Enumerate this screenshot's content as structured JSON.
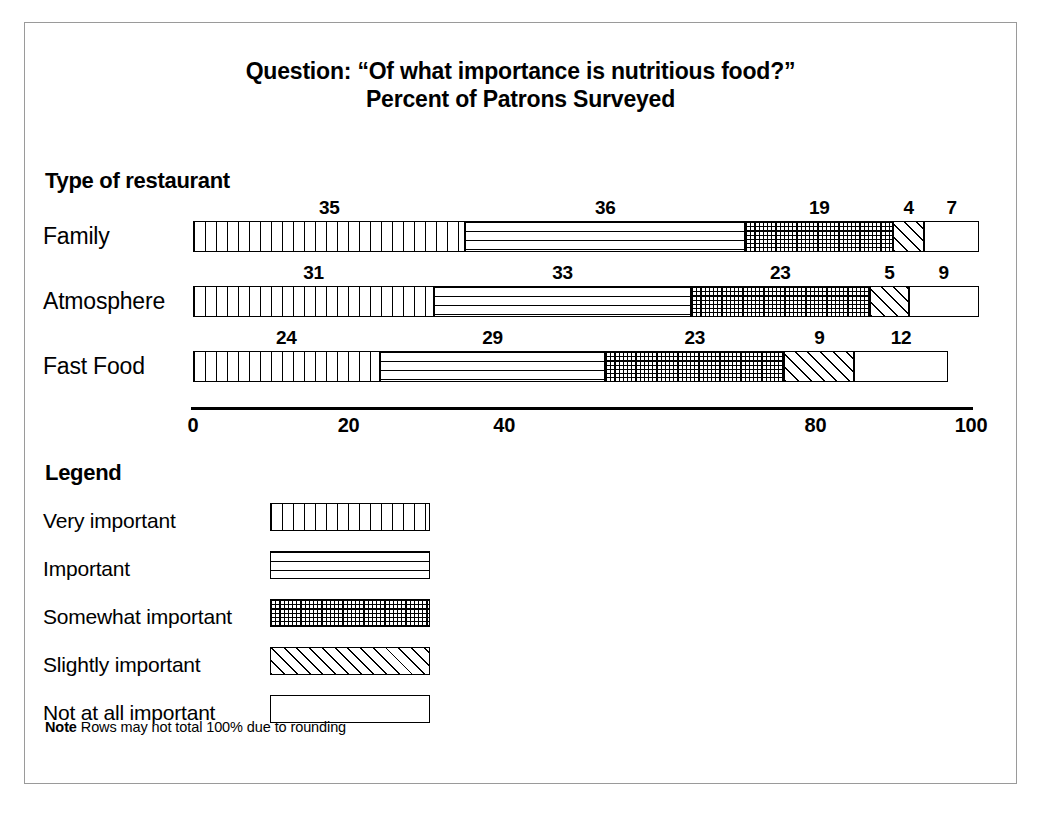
{
  "chart_data": {
    "type": "bar",
    "orientation": "horizontal",
    "stacked": true,
    "title": "Question: “Of what importance is nutritious food?”",
    "subtitle": "Percent of Patrons Surveyed",
    "category_axis_title": "Type of restaurant",
    "categories": [
      "Family",
      "Atmosphere",
      "Fast Food"
    ],
    "series": [
      {
        "name": "Very important",
        "pattern": "vertical",
        "values": [
          35,
          31,
          24
        ]
      },
      {
        "name": "Important",
        "pattern": "horizontal",
        "values": [
          36,
          33,
          29
        ]
      },
      {
        "name": "Somewhat important",
        "pattern": "grid",
        "values": [
          19,
          23,
          23
        ]
      },
      {
        "name": "Slightly important",
        "pattern": "diagonal",
        "values": [
          4,
          5,
          9
        ]
      },
      {
        "name": "Not at all important",
        "pattern": "blank",
        "values": [
          7,
          9,
          12
        ]
      }
    ],
    "xlabel": "",
    "ylabel": "",
    "xlim": [
      0,
      100
    ],
    "xticks": [
      0,
      20,
      40,
      80,
      100
    ],
    "xtick_labels": [
      "0",
      "20",
      "40",
      "80",
      "100"
    ],
    "grid": false,
    "legend_position": "below-plot-left",
    "note": "Rows may not total 100% due to rounding"
  },
  "title": {
    "line1": "Question: “Of what importance is nutritious food?”",
    "line2": "Percent of Patrons Surveyed"
  },
  "plot": {
    "group_heading": "Type of restaurant",
    "rows": [
      {
        "label": "Family",
        "segments": [
          {
            "value": "35",
            "amount": 35,
            "pattern": "vertical"
          },
          {
            "value": "36",
            "amount": 36,
            "pattern": "horizontal"
          },
          {
            "value": "19",
            "amount": 19,
            "pattern": "grid"
          },
          {
            "value": "4",
            "amount": 4,
            "pattern": "diagonal"
          },
          {
            "value": "7",
            "amount": 7,
            "pattern": "blank"
          }
        ]
      },
      {
        "label": "Atmosphere",
        "segments": [
          {
            "value": "31",
            "amount": 31,
            "pattern": "vertical"
          },
          {
            "value": "33",
            "amount": 33,
            "pattern": "horizontal"
          },
          {
            "value": "23",
            "amount": 23,
            "pattern": "grid"
          },
          {
            "value": "5",
            "amount": 5,
            "pattern": "diagonal"
          },
          {
            "value": "9",
            "amount": 9,
            "pattern": "blank"
          }
        ]
      },
      {
        "label": "Fast Food",
        "segments": [
          {
            "value": "24",
            "amount": 24,
            "pattern": "vertical"
          },
          {
            "value": "29",
            "amount": 29,
            "pattern": "horizontal"
          },
          {
            "value": "23",
            "amount": 23,
            "pattern": "grid"
          },
          {
            "value": "9",
            "amount": 9,
            "pattern": "diagonal"
          },
          {
            "value": "12",
            "amount": 12,
            "pattern": "blank"
          }
        ]
      }
    ]
  },
  "axis": {
    "ticks": [
      {
        "label": "0",
        "position": 0
      },
      {
        "label": "20",
        "position": 20
      },
      {
        "label": "40",
        "position": 40
      },
      {
        "label": "80",
        "position": 80
      },
      {
        "label": "100",
        "position": 100
      }
    ]
  },
  "legend": {
    "heading": "Legend",
    "items": [
      {
        "label": "Very important",
        "pattern": "vertical"
      },
      {
        "label": "Important",
        "pattern": "horizontal"
      },
      {
        "label": "Somewhat important",
        "pattern": "grid"
      },
      {
        "label": "Slightly important",
        "pattern": "diagonal"
      },
      {
        "label": "Not at all important",
        "pattern": "blank"
      }
    ]
  },
  "note": {
    "label": "Note",
    "text": "Rows may not total 100% due to rounding"
  }
}
